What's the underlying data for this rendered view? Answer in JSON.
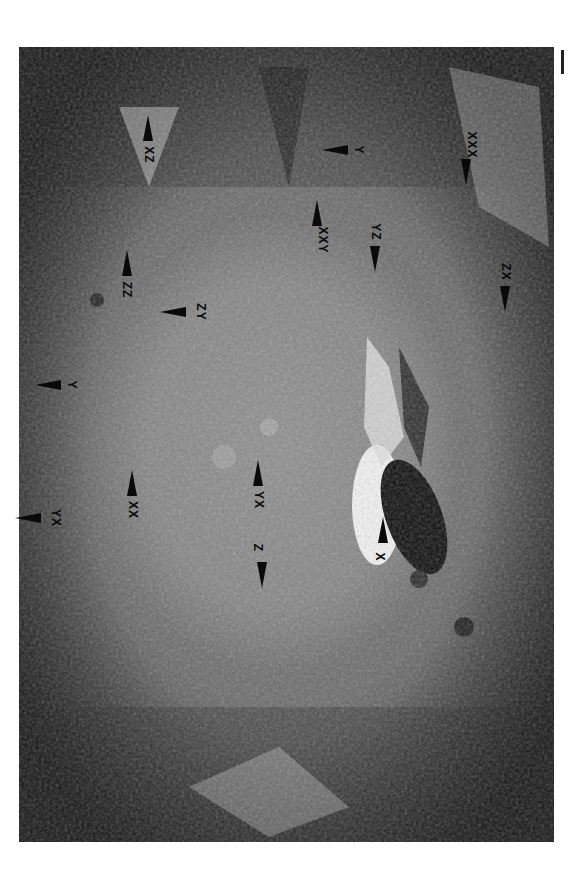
{
  "image": {
    "subject": "lunar crater floor with central peak, oblique view",
    "scale_bar": true
  },
  "labels": [
    {
      "id": "xz",
      "text": "XZ",
      "x": 148,
      "y": 155,
      "arrow": "up"
    },
    {
      "id": "zz",
      "text": "ZZ",
      "x": 127,
      "y": 290,
      "arrow": "up"
    },
    {
      "id": "zy",
      "text": "ZY",
      "x": 200,
      "y": 312,
      "arrow": "left"
    },
    {
      "id": "y-left",
      "text": "Y",
      "x": 75,
      "y": 385,
      "arrow": "left"
    },
    {
      "id": "yx-left",
      "text": "YX",
      "x": 55,
      "y": 518,
      "arrow": "left"
    },
    {
      "id": "xx",
      "text": "XX",
      "x": 132,
      "y": 510,
      "arrow": "up"
    },
    {
      "id": "yx-center",
      "text": "YX",
      "x": 258,
      "y": 500,
      "arrow": "up"
    },
    {
      "id": "z",
      "text": "Z",
      "x": 262,
      "y": 548,
      "arrow": "down"
    },
    {
      "id": "x",
      "text": "X",
      "x": 383,
      "y": 557,
      "arrow": "up"
    },
    {
      "id": "xxy",
      "text": "XXY",
      "x": 317,
      "y": 240,
      "arrow": "up"
    },
    {
      "id": "yz",
      "text": "YZ",
      "x": 375,
      "y": 232,
      "arrow": "down"
    },
    {
      "id": "y-right",
      "text": "Y",
      "x": 362,
      "y": 150,
      "arrow": "left"
    },
    {
      "id": "xxx",
      "text": "XXX",
      "x": 466,
      "y": 145,
      "arrow": "down"
    },
    {
      "id": "zx",
      "text": "ZX",
      "x": 505,
      "y": 272,
      "arrow": "down"
    }
  ]
}
